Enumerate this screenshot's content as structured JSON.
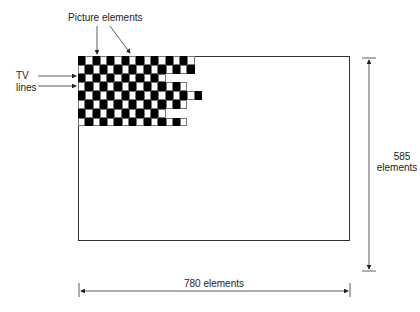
{
  "labels": {
    "picture_elements": "Picture elements",
    "tv_lines_1": "TV",
    "tv_lines_2": "lines",
    "vertical_count": "585",
    "vertical_unit": "elements",
    "horizontal": "780 elements"
  },
  "grid": {
    "row_lengths": [
      16,
      16,
      12,
      15,
      17,
      15,
      12,
      15
    ],
    "first_cell_black": [
      true,
      false,
      true,
      false,
      true,
      false,
      true,
      false
    ]
  },
  "colors": {
    "ink": "#222222",
    "cell_black": "#000000",
    "cell_white": "#ffffff"
  }
}
